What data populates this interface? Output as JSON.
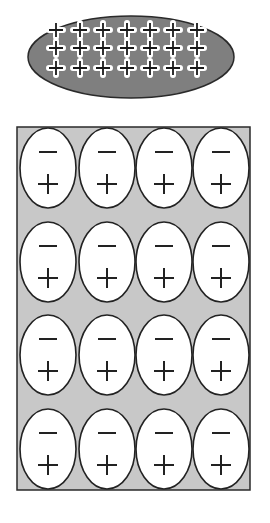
{
  "diagram": {
    "title": "",
    "colors": {
      "background": "#ffffff",
      "plate_fill": "#7f7f7f",
      "plate_stroke": "#2a2a2a",
      "plus_stroke": "#1a1a1a",
      "plus_halo": "#ffffff",
      "slab_fill": "#c8c8c8",
      "slab_stroke": "#2a2a2a",
      "dipole_fill": "#ffffff",
      "dipole_stroke": "#222222",
      "symbol_stroke": "#222222"
    },
    "charged_plate": {
      "shape": "ellipse",
      "cx": 131,
      "cy": 57,
      "rx": 103,
      "ry": 41,
      "charge_symbol": "+",
      "rows": 3,
      "cols": 7,
      "row_y": [
        30,
        48,
        68
      ],
      "col_x": [
        56,
        80,
        103,
        127,
        150,
        173,
        197
      ]
    },
    "dielectric_slab": {
      "shape": "rectangle",
      "x": 17,
      "y": 127,
      "width": 233,
      "height": 363,
      "rows": 4,
      "cols": 4,
      "dipole": {
        "shape": "ellipse",
        "rx": 28,
        "ry": 40,
        "top_symbol": "−",
        "bottom_symbol": "+"
      },
      "row_cy": [
        168,
        262,
        355,
        449
      ],
      "col_cx": [
        48,
        107,
        164,
        221
      ]
    }
  }
}
